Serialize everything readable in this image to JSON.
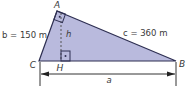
{
  "diagram": {
    "type": "right-triangle-with-altitude",
    "colors": {
      "fill": "#b9badd",
      "stroke": "#2e2f52",
      "text": "#3a3a3a",
      "dashed": "#555555"
    },
    "vertices": {
      "A": "A",
      "B": "B",
      "C": "C",
      "H": "H"
    },
    "labels": {
      "side_b": "b = 150 m",
      "side_c": "c = 360 m",
      "side_a": "a",
      "height": "h"
    },
    "right_angles": [
      "A",
      "H"
    ]
  }
}
